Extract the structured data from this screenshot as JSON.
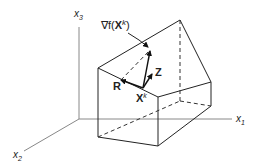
{
  "diagram": {
    "axes": {
      "x1": {
        "label": "x",
        "subscript": "1"
      },
      "x2": {
        "label": "x",
        "subscript": "2"
      },
      "x3": {
        "label": "x",
        "subscript": "3"
      }
    },
    "labels": {
      "gradient": {
        "prefix": "∇f(",
        "bold": "X",
        "superscript": "k",
        "suffix": ")"
      },
      "point": {
        "bold": "X",
        "superscript": "k"
      },
      "R": "R",
      "Z": "Z"
    },
    "colors": {
      "background": "#ffffff",
      "edges": "#222222",
      "axes": "#888888"
    }
  }
}
